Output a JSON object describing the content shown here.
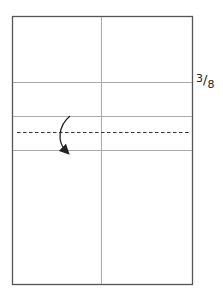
{
  "diagram": {
    "type": "folding-instruction",
    "fraction_label": {
      "numerator": "3",
      "slash": "/",
      "denominator": "8"
    },
    "lines": {
      "outer_border": "solid",
      "center_vertical": "solid crease",
      "creases_horizontal": 3,
      "fold_line": "dashed"
    },
    "arrow": "curved fold arrow pointing down",
    "colors": {
      "border": "#555555",
      "crease": "#aaaaaa",
      "dashed": "#333333",
      "arrow": "#222222"
    }
  }
}
